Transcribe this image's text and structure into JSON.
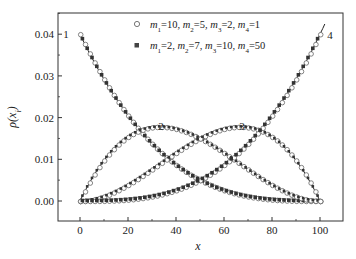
{
  "chart_data": {
    "type": "line",
    "title": "",
    "xlabel": "x",
    "ylabel": "ρ(x_i)",
    "xlim": [
      -10,
      110
    ],
    "ylim": [
      -0.005,
      0.045
    ],
    "xticks": [
      0,
      20,
      40,
      60,
      80,
      100
    ],
    "xtick_labels": [
      "0",
      "20",
      "40",
      "60",
      "80",
      "100"
    ],
    "yticks": [
      0.0,
      0.01,
      0.02,
      0.03,
      0.04
    ],
    "ytick_labels": [
      "0.00",
      "0.01",
      "0.02",
      "0.03",
      "0.04"
    ],
    "grid": false,
    "legend_position": "upper center",
    "legend": [
      {
        "marker": "open-circle",
        "label": "m1=10, m2=5, m3=2, m4=1"
      },
      {
        "marker": "filled-square",
        "label": "m1=2, m2=7, m3=10, m4=50"
      }
    ],
    "curve_labels": [
      {
        "id": "1",
        "x": 0,
        "y": 0.04
      },
      {
        "id": "2",
        "x": 33,
        "y": 0.0185
      },
      {
        "id": "3",
        "x": 67,
        "y": 0.0185
      },
      {
        "id": "4",
        "x": 102,
        "y": 0.04
      }
    ],
    "x": [
      0,
      10,
      20,
      30,
      40,
      50,
      60,
      70,
      80,
      90,
      100
    ],
    "series": [
      {
        "name": "curve 1 (theory)",
        "values": [
          0.04,
          0.0292,
          0.0205,
          0.0137,
          0.0086,
          0.005,
          0.0026,
          0.0011,
          0.0003,
          4e-05,
          0.0
        ]
      },
      {
        "name": "curve 2 (theory)",
        "values": [
          0.0,
          0.0097,
          0.0154,
          0.0176,
          0.0173,
          0.015,
          0.0115,
          0.0076,
          0.0038,
          0.0011,
          0.0
        ]
      },
      {
        "name": "curve 3 (theory)",
        "values": [
          0.0,
          0.0011,
          0.0038,
          0.0076,
          0.0115,
          0.015,
          0.0173,
          0.0176,
          0.0154,
          0.0097,
          0.0
        ]
      },
      {
        "name": "curve 4 (theory)",
        "values": [
          0.0,
          4e-05,
          0.0003,
          0.0011,
          0.0026,
          0.005,
          0.0086,
          0.0137,
          0.0205,
          0.0292,
          0.04
        ]
      }
    ]
  },
  "axes": {
    "xlabel": "x",
    "ylabel_main": "ρ(x",
    "ylabel_sub": "i",
    "ylabel_close": ")"
  },
  "legend": {
    "row1": {
      "m1": "10",
      "m2": "5",
      "m3": "2",
      "m4": "1"
    },
    "row2": {
      "m1": "2",
      "m2": "7",
      "m3": "10",
      "m4": "50"
    }
  }
}
